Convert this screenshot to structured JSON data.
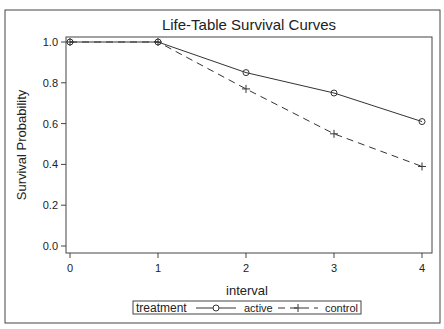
{
  "chart_data": {
    "type": "line",
    "title": "Life-Table Survival Curves",
    "xlabel": "interval",
    "ylabel": "Survival Probability",
    "x": [
      0,
      1,
      2,
      3,
      4
    ],
    "x_ticks": [
      "0",
      "1",
      "2",
      "3",
      "4"
    ],
    "y_ticks": [
      "0.0",
      "0.2",
      "0.4",
      "0.6",
      "0.8",
      "1.0"
    ],
    "xlim": [
      0,
      4
    ],
    "ylim": [
      0,
      1.0
    ],
    "grid": false,
    "legend_position": "bottom",
    "legend_title": "treatment",
    "series": [
      {
        "name": "active",
        "marker": "circle",
        "line": "solid",
        "values": [
          1.0,
          1.0,
          0.85,
          0.75,
          0.61
        ]
      },
      {
        "name": "control",
        "marker": "plus",
        "line": "dashed",
        "values": [
          1.0,
          1.0,
          0.77,
          0.55,
          0.39
        ]
      }
    ]
  },
  "colors": {
    "line": "#333333",
    "frame": "#444444",
    "background": "#ffffff"
  }
}
